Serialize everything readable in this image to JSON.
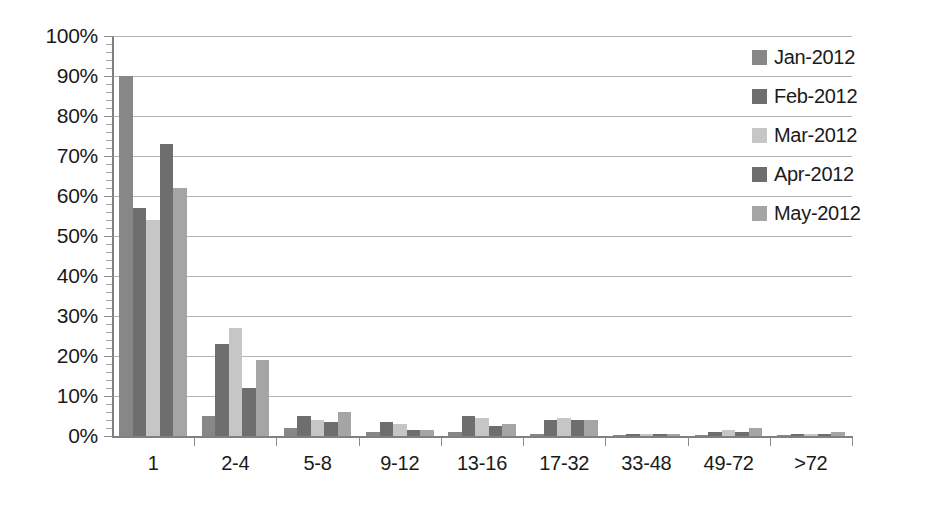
{
  "chart_data": {
    "type": "bar",
    "title": "",
    "subtitle": "",
    "xlabel": "",
    "ylabel": "",
    "ylim": [
      0,
      100
    ],
    "y_unit": "%",
    "y_ticks": [
      "0%",
      "10%",
      "20%",
      "30%",
      "40%",
      "50%",
      "60%",
      "70%",
      "80%",
      "90%",
      "100%"
    ],
    "y_tick_values": [
      0,
      10,
      20,
      30,
      40,
      50,
      60,
      70,
      80,
      90,
      100
    ],
    "y_minor_tick_interval": 2,
    "grid": true,
    "grid_axis": "y",
    "legend_position": "right",
    "categories": [
      "1",
      "2-4",
      "5-8",
      "9-12",
      "13-16",
      "17-32",
      "33-48",
      "49-72",
      ">72"
    ],
    "series": [
      {
        "name": "Jan-2012",
        "color": "#878787",
        "values": [
          90,
          5,
          2,
          1,
          1,
          0.4,
          0.3,
          0.3,
          0.3
        ]
      },
      {
        "name": "Feb-2012",
        "color": "#6e6e6e",
        "values": [
          57,
          23,
          5,
          3.5,
          5,
          4,
          0.5,
          1,
          0.5
        ]
      },
      {
        "name": "Mar-2012",
        "color": "#c6c6c6",
        "values": [
          54,
          27,
          4,
          3,
          4.5,
          4.5,
          0.5,
          1.5,
          0.5
        ]
      },
      {
        "name": "Apr-2012",
        "color": "#6e6e6e",
        "values": [
          73,
          12,
          3.5,
          1.5,
          2.5,
          4,
          0.4,
          1,
          0.4
        ]
      },
      {
        "name": "May-2012",
        "color": "#a5a5a5",
        "values": [
          62,
          19,
          6,
          1.5,
          3,
          4,
          0.4,
          2,
          1
        ]
      }
    ]
  },
  "legend": {
    "items": [
      {
        "label": "Jan-2012"
      },
      {
        "label": "Feb-2012"
      },
      {
        "label": "Mar-2012"
      },
      {
        "label": "Apr-2012"
      },
      {
        "label": "May-2012"
      }
    ]
  }
}
